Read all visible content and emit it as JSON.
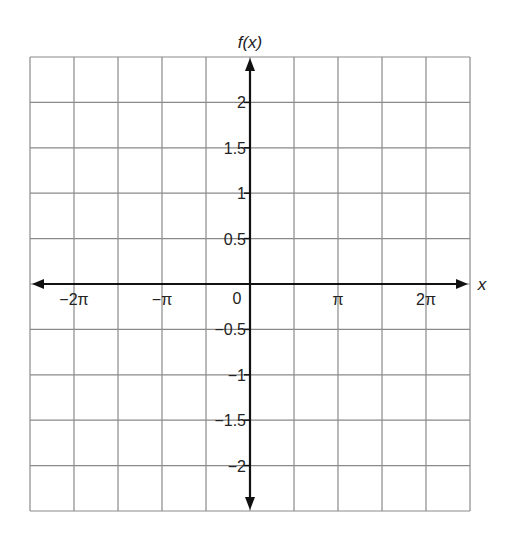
{
  "chart_data": {
    "type": "line",
    "title": "",
    "xlabel": "x",
    "ylabel": "f(x)",
    "xlim": [
      "-2.5π",
      "2.5π"
    ],
    "ylim": [
      -2.5,
      2.5
    ],
    "grid": true,
    "series": [],
    "x_ticks": [
      {
        "label": "−2π",
        "value": -6.2832
      },
      {
        "label": "−π",
        "value": -3.1416
      },
      {
        "label": "π",
        "value": 3.1416
      },
      {
        "label": "2π",
        "value": 6.2832
      }
    ],
    "origin_label": "0",
    "y_ticks": [
      {
        "label": "2",
        "value": 2
      },
      {
        "label": "1.5",
        "value": 1.5
      },
      {
        "label": "1",
        "value": 1
      },
      {
        "label": "0.5",
        "value": 0.5
      },
      {
        "label": "−0.5",
        "value": -0.5
      },
      {
        "label": "−1",
        "value": -1
      },
      {
        "label": "−1.5",
        "value": -1.5
      },
      {
        "label": "−2",
        "value": -2
      }
    ],
    "grid_columns": 10,
    "grid_rows": 10,
    "colors": {
      "grid": "#8a8a8a",
      "axis": "#111111",
      "text": "#222222"
    }
  }
}
